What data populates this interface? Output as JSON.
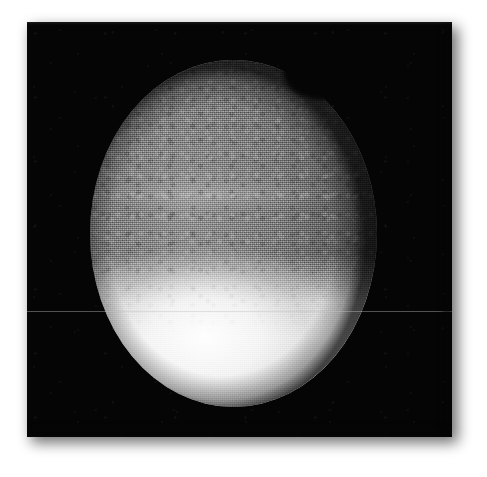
{
  "figure": {
    "kind": "astronomical-photograph",
    "medium": "monochrome grainy print / photographic plate",
    "subject_description": "Planetary disk with dark northern hemisphere and bright southern polar cap",
    "caption": "",
    "background_color": "#ffffff",
    "plate_color": "#050505"
  },
  "plate": {
    "x": 27,
    "y": 22,
    "width": 425,
    "height": 415,
    "has_drop_shadow": true,
    "shadow_side": "bottom-right"
  },
  "disk": {
    "center_x": 206,
    "center_y": 233,
    "radius_x": 143,
    "radius_y": 173,
    "shape": "ellipse",
    "orientation": "tall",
    "features": [
      {
        "name": "southern-polar-cap",
        "brightness": "very bright, near white",
        "boundary_y": 300,
        "color": "#f6f6f6"
      },
      {
        "name": "dark-northern-hemisphere",
        "brightness": "dark grey, heavy grain",
        "color": "#4a4a4a"
      },
      {
        "name": "mid-latitude-bright-band",
        "brightness": "faint brighter band",
        "color": "#8a8a8a"
      },
      {
        "name": "limb-notch-upper-right",
        "brightness": "dark bite in the limb",
        "color": "#050505"
      },
      {
        "name": "limb-darkening-right",
        "brightness": "dark falloff toward right limb",
        "color": "#232323"
      }
    ]
  },
  "artifacts": {
    "scanline": {
      "name": "horizontal-scan-line",
      "y": 311,
      "color": "#bebebe",
      "opacity": 0.42,
      "spans_full_width": true
    },
    "grain": {
      "name": "film-grain",
      "intensity": "heavy"
    }
  },
  "annotations": {
    "labels": [],
    "scale_bar": null,
    "axis_ticks": []
  }
}
